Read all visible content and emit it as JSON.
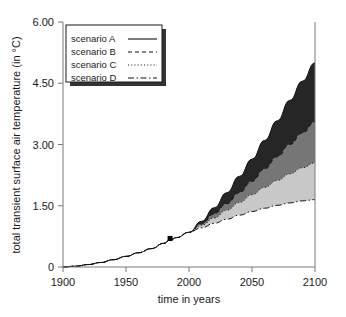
{
  "chart_data": {
    "type": "area",
    "title": "",
    "xlabel": "time in years",
    "ylabel": "total transient surface air temperature (in °C)",
    "xlim": [
      1900,
      2100
    ],
    "ylim": [
      0,
      6.0
    ],
    "xticks": [
      "1900",
      "1950",
      "2000",
      "2050",
      "2100"
    ],
    "xtick_values": [
      1900,
      1950,
      2000,
      2050,
      2100
    ],
    "yticks": [
      "0",
      "1.50",
      "3.00",
      "4.50",
      "6.00"
    ],
    "ytick_values": [
      0,
      1.5,
      3.0,
      4.5,
      6.0
    ],
    "grid": false,
    "legend_position": "top-left",
    "x": [
      1900,
      1910,
      1920,
      1930,
      1940,
      1950,
      1960,
      1970,
      1980,
      1985,
      1990,
      2000,
      2010,
      2020,
      2030,
      2040,
      2050,
      2060,
      2070,
      2080,
      2090,
      2100
    ],
    "series": [
      {
        "name": "scenario A",
        "label": "scenario A",
        "linestyle": "solid",
        "values": [
          0.0,
          0.02,
          0.06,
          0.11,
          0.18,
          0.26,
          0.35,
          0.45,
          0.58,
          0.66,
          0.72,
          0.85,
          1.12,
          1.45,
          1.82,
          2.22,
          2.64,
          3.1,
          3.58,
          4.08,
          4.55,
          5.0
        ]
      },
      {
        "name": "scenario B",
        "label": "scenario B",
        "linestyle": "dashed",
        "values": [
          0.0,
          0.02,
          0.06,
          0.11,
          0.18,
          0.26,
          0.35,
          0.45,
          0.58,
          0.66,
          0.72,
          0.85,
          1.06,
          1.3,
          1.55,
          1.82,
          2.1,
          2.4,
          2.7,
          3.0,
          3.28,
          3.55
        ]
      },
      {
        "name": "scenario C",
        "label": "scenario C",
        "linestyle": "dotted",
        "values": [
          0.0,
          0.02,
          0.06,
          0.11,
          0.18,
          0.26,
          0.35,
          0.45,
          0.58,
          0.66,
          0.72,
          0.85,
          1.02,
          1.2,
          1.39,
          1.58,
          1.77,
          1.95,
          2.12,
          2.28,
          2.43,
          2.55
        ]
      },
      {
        "name": "scenario D",
        "label": "scenario D",
        "linestyle": "dash-dot",
        "values": [
          0.0,
          0.02,
          0.06,
          0.11,
          0.18,
          0.26,
          0.35,
          0.45,
          0.58,
          0.66,
          0.72,
          0.85,
          0.96,
          1.07,
          1.17,
          1.27,
          1.36,
          1.44,
          1.51,
          1.57,
          1.62,
          1.65
        ]
      }
    ],
    "bands": [
      {
        "name": "band-a-b",
        "upper": "scenario A",
        "lower": "scenario B",
        "color": "#262626"
      },
      {
        "name": "band-b-c",
        "upper": "scenario B",
        "lower": "scenario C",
        "color": "#767676"
      },
      {
        "name": "band-c-d",
        "upper": "scenario C",
        "lower": "scenario D",
        "color": "#c8c8c8"
      }
    ],
    "annotations": [
      {
        "name": "observation-marker",
        "x": 1985,
        "y": 0.7,
        "marker": "square",
        "color": "#000000"
      }
    ]
  },
  "legend": {
    "entries": [
      {
        "label": "scenario A",
        "style": "solid"
      },
      {
        "label": "scenario B",
        "style": "dashed"
      },
      {
        "label": "scenario C",
        "style": "dotted"
      },
      {
        "label": "scenario D",
        "style": "dash-dot"
      }
    ]
  },
  "colors": {
    "background": "#ffffff",
    "axis": "#7a7a7a",
    "text": "#1a1a1a",
    "band_dark": "#262626",
    "band_medium": "#767676",
    "band_light": "#c8c8c8",
    "legend_shadow": "#333333"
  }
}
